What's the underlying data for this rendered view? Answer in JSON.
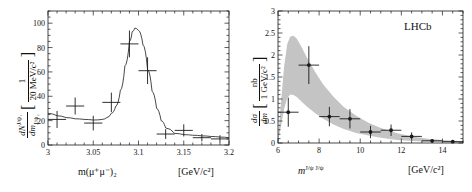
{
  "figure": {
    "kind": "two-panel-physics-figure",
    "background": "#ffffff",
    "ink_color": "#1a1a1a",
    "band_color": "#c4c4c4"
  },
  "chart_data": [
    {
      "type": "scatter",
      "panel": "left",
      "title": "",
      "xlabel": "m(μ⁺μ⁻)₂",
      "xunits": "[GeV/c²]",
      "ylabel": "dN^{J/ψ₁}/dm_{J/ψ₂}",
      "yunits": "[1/(20 MeV/c²)]",
      "xlim": [
        3.0,
        3.2
      ],
      "ylim": [
        0,
        110
      ],
      "xticks": [
        3,
        3.05,
        3.1,
        3.15,
        3.2
      ],
      "xtick_labels": [
        "3",
        "3.05",
        "3.1",
        "3.15",
        "3.2"
      ],
      "yticks": [
        0,
        20,
        40,
        60,
        80,
        100
      ],
      "ytick_labels": [
        "0",
        "20",
        "40",
        "60",
        "80",
        "100"
      ],
      "grid": false,
      "legend": "none",
      "x": [
        3.01,
        3.03,
        3.05,
        3.07,
        3.09,
        3.11,
        3.13,
        3.15,
        3.17,
        3.19
      ],
      "values": [
        21,
        32,
        18,
        35,
        83,
        61,
        9,
        12,
        6,
        5
      ],
      "yerr": [
        7,
        7,
        6,
        8,
        11,
        11,
        4,
        5,
        3,
        3
      ],
      "xerr": [
        0.01,
        0.01,
        0.01,
        0.01,
        0.01,
        0.01,
        0.01,
        0.01,
        0.01,
        0.01
      ],
      "fit_curve": {
        "description": "Breit-Wigner J/psi peak over smooth background",
        "x": [
          3.0,
          3.01,
          3.02,
          3.03,
          3.04,
          3.05,
          3.06,
          3.065,
          3.07,
          3.075,
          3.08,
          3.085,
          3.09,
          3.093,
          3.096,
          3.1,
          3.105,
          3.11,
          3.115,
          3.12,
          3.125,
          3.13,
          3.14,
          3.15,
          3.16,
          3.17,
          3.18,
          3.19,
          3.2
        ],
        "y": [
          26,
          24,
          22.5,
          21.5,
          21,
          20.5,
          21,
          22.5,
          26,
          32,
          45,
          65,
          85,
          93,
          96,
          94,
          82,
          62,
          44,
          30,
          20,
          14,
          9.5,
          8.5,
          8,
          7.5,
          7,
          6.5,
          6
        ]
      }
    },
    {
      "type": "scatter",
      "panel": "right",
      "title": "LHCb",
      "xlabel": "m^{J/ψ J/ψ}",
      "xunits": "[GeV/c²]",
      "ylabel": "dσ/dm",
      "yunits": "[nb/(1 GeV/c²)]",
      "xlim": [
        6,
        15
      ],
      "ylim": [
        0,
        3
      ],
      "xticks": [
        6,
        8,
        10,
        12,
        14
      ],
      "xtick_labels": [
        "6",
        "8",
        "10",
        "12",
        "14"
      ],
      "yticks": [
        0,
        0.5,
        1,
        1.5,
        2,
        2.5,
        3
      ],
      "ytick_labels": [
        "0",
        "0.5",
        "1",
        "1.5",
        "2",
        "2.5",
        "3"
      ],
      "grid": false,
      "legend": "none",
      "x": [
        6.5,
        7.5,
        8.5,
        9.5,
        10.5,
        11.5,
        12.5,
        13.5,
        14.5
      ],
      "values": [
        0.7,
        1.77,
        0.6,
        0.55,
        0.25,
        0.29,
        0.15,
        0.05,
        0.03
      ],
      "yerr": [
        0.33,
        0.43,
        0.22,
        0.22,
        0.14,
        0.13,
        0.09,
        0.04,
        0.02
      ],
      "xerr": [
        0.5,
        0.5,
        0.5,
        0.5,
        0.5,
        0.5,
        0.5,
        0.5,
        0.5
      ],
      "band": {
        "name": "theory-uncertainty-band",
        "color": "#c4c4c4",
        "x": [
          6.0,
          6.15,
          6.3,
          6.45,
          6.6,
          6.75,
          6.9,
          7.1,
          7.4,
          7.8,
          8.2,
          8.7,
          9.2,
          9.8,
          10.4,
          11.0,
          11.8,
          12.6,
          13.4,
          14.2,
          15.0
        ],
        "upper": [
          0.05,
          0.95,
          1.75,
          2.25,
          2.42,
          2.44,
          2.38,
          2.22,
          1.95,
          1.62,
          1.33,
          1.05,
          0.82,
          0.62,
          0.46,
          0.34,
          0.22,
          0.14,
          0.09,
          0.06,
          0.04
        ],
        "lower": [
          0.02,
          0.4,
          0.78,
          1.02,
          1.1,
          1.09,
          1.05,
          0.96,
          0.83,
          0.68,
          0.55,
          0.42,
          0.32,
          0.23,
          0.17,
          0.12,
          0.07,
          0.045,
          0.03,
          0.02,
          0.013
        ]
      }
    }
  ],
  "left_panel": {
    "ylabel_num": "dN",
    "ylabel_num_sup": "J/ψ₁",
    "ylabel_den": "dm",
    "ylabel_den_sub": "J/ψ₂",
    "unit_num": "1",
    "unit_den": "20 MeV/c²",
    "xcaption": "m(μ⁺μ⁻)₂",
    "xunits": "[GeV/c²]",
    "xtick_labels": [
      "3",
      "3.05",
      "3.1",
      "3.15",
      "3.2"
    ],
    "ytick_labels": [
      "0",
      "20",
      "40",
      "60",
      "80",
      "100"
    ]
  },
  "right_panel": {
    "ylabel_num": "dσ",
    "ylabel_den": "dm",
    "unit_num": "nb",
    "unit_den": "1 GeV/c²",
    "xcaption_base": "m",
    "xcaption_sup": "J/ψ J/ψ",
    "xunits": "[GeV/c²]",
    "experiment": "LHCb",
    "xtick_labels": [
      "6",
      "8",
      "10",
      "12",
      "14"
    ],
    "ytick_labels": [
      "0",
      "0.5",
      "1",
      "1.5",
      "2",
      "2.5",
      "3"
    ]
  }
}
